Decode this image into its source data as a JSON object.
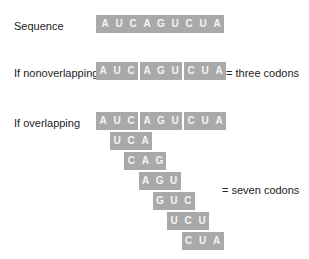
{
  "sequence": {
    "label": "Sequence",
    "bases": [
      "A",
      "U",
      "C",
      "A",
      "G",
      "U",
      "C",
      "U",
      "A"
    ]
  },
  "nonoverlapping": {
    "label": "If nonoverlapping",
    "codons": [
      [
        "A",
        "U",
        "C"
      ],
      [
        "A",
        "G",
        "U"
      ],
      [
        "C",
        "U",
        "A"
      ]
    ],
    "result": "= three codons"
  },
  "overlapping": {
    "label": "If overlapping",
    "top_codons": [
      [
        "A",
        "U",
        "C"
      ],
      [
        "A",
        "G",
        "U"
      ],
      [
        "C",
        "U",
        "A"
      ]
    ],
    "stacked_codons": [
      [
        "U",
        "C",
        "A"
      ],
      [
        "C",
        "A",
        "G"
      ],
      [
        "A",
        "G",
        "U"
      ],
      [
        "G",
        "U",
        "C"
      ],
      [
        "U",
        "C",
        "U"
      ],
      [
        "C",
        "U",
        "A"
      ]
    ],
    "result": "= seven codons"
  },
  "colors": {
    "box": "#a9a9a9",
    "box_text": "#f4f4f4",
    "text": "#222222"
  }
}
